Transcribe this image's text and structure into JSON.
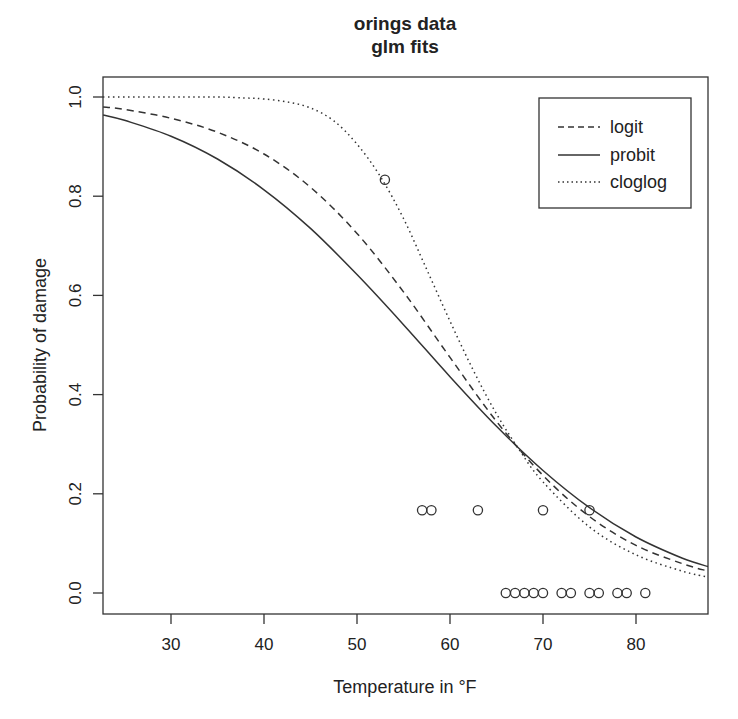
{
  "chart_data": {
    "type": "line",
    "title": "orings data",
    "subtitle": "glm fits",
    "xlabel": "Temperature in °F",
    "ylabel": "Probability of damage",
    "xlim": [
      22.7,
      87.8
    ],
    "ylim": [
      -0.04,
      1.04
    ],
    "xticks": [
      30,
      40,
      50,
      60,
      70,
      80
    ],
    "yticks": [
      0.0,
      0.2,
      0.4,
      0.6,
      0.8,
      1.0
    ],
    "ytick_labels": [
      "0.0",
      "0.2",
      "0.4",
      "0.6",
      "0.8",
      "1.0"
    ],
    "grid": false,
    "legend_position": "top-right",
    "series": [
      {
        "name": "logit",
        "style": "dashed",
        "x": [
          22.7,
          25,
          30,
          35,
          40,
          45,
          50,
          55,
          60,
          65,
          70,
          75,
          80,
          85,
          87.8
        ],
        "y": [
          0.98,
          0.975,
          0.957,
          0.929,
          0.885,
          0.818,
          0.725,
          0.607,
          0.475,
          0.346,
          0.237,
          0.154,
          0.096,
          0.059,
          0.044
        ]
      },
      {
        "name": "probit",
        "style": "solid",
        "x": [
          22.7,
          25,
          30,
          35,
          40,
          45,
          50,
          55,
          60,
          65,
          70,
          75,
          80,
          85,
          87.8
        ],
        "y": [
          0.964,
          0.953,
          0.921,
          0.875,
          0.813,
          0.735,
          0.642,
          0.541,
          0.436,
          0.336,
          0.247,
          0.172,
          0.113,
          0.07,
          0.053
        ]
      },
      {
        "name": "cloglog",
        "style": "dotted",
        "x": [
          22.7,
          30,
          35,
          38,
          40,
          42.5,
          45,
          47.5,
          50,
          52.5,
          55,
          57.5,
          60,
          62.5,
          65,
          67.5,
          70,
          75,
          80,
          85,
          87.8
        ],
        "y": [
          1.0,
          1.0,
          1.0,
          0.998,
          0.996,
          0.99,
          0.978,
          0.952,
          0.905,
          0.84,
          0.755,
          0.652,
          0.548,
          0.449,
          0.361,
          0.287,
          0.224,
          0.133,
          0.077,
          0.044,
          0.032
        ]
      }
    ],
    "points": {
      "name": "observed",
      "marker": "open-circle",
      "x": [
        53,
        57,
        58,
        63,
        70,
        75,
        66,
        67,
        68,
        69,
        70,
        72,
        73,
        75,
        76,
        78,
        79,
        81
      ],
      "y": [
        0.833,
        0.167,
        0.167,
        0.167,
        0.167,
        0.167,
        0,
        0,
        0,
        0,
        0,
        0,
        0,
        0,
        0,
        0,
        0,
        0
      ]
    }
  },
  "layout": {
    "plot_px": {
      "left": 103,
      "right": 708,
      "top": 77,
      "bottom": 614
    },
    "legend_px": {
      "left": 539,
      "top": 98,
      "width": 152,
      "height": 110
    }
  }
}
